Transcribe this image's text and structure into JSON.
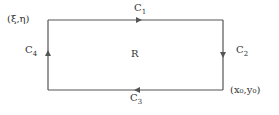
{
  "diagram": {
    "region_label": "R",
    "corner_top_left": "(ξ,η)",
    "corner_bottom_right": "(x₀,y₀)",
    "curves": [
      {
        "name": "C",
        "sub": "1",
        "side": "top",
        "direction": "right"
      },
      {
        "name": "C",
        "sub": "2",
        "side": "right",
        "direction": "down"
      },
      {
        "name": "C",
        "sub": "3",
        "side": "bottom",
        "direction": "left"
      },
      {
        "name": "C",
        "sub": "4",
        "side": "left",
        "direction": "up"
      }
    ],
    "line_color": "#555555"
  }
}
